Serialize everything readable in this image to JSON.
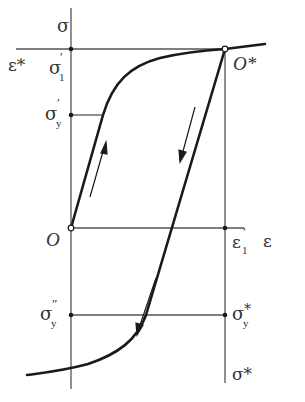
{
  "diagram": {
    "type": "stress-strain hysteresis (Bauschinger effect)",
    "colors": {
      "line": "#1a1a1a",
      "axis": "#555555",
      "text": "#333333",
      "background": "#ffffff"
    },
    "axes": {
      "y_label": "σ",
      "x_label": "ε"
    },
    "points": {
      "origin": "O",
      "reload_origin": "O*"
    },
    "labels": {
      "eps_star": "ε*",
      "sigma1_prime": {
        "base": "σ",
        "sup": "′",
        "sub": "1"
      },
      "sigmay_prime": {
        "base": "σ",
        "sup": "′",
        "sub": "y"
      },
      "eps1_prime": {
        "base": "ε",
        "sup": "′",
        "sub": "1"
      },
      "sigmay_double_prime": {
        "base": "σ",
        "sup": "″",
        "sub": "y"
      },
      "sigmay_star": {
        "base": "σ",
        "sup": "*",
        "sub": "y"
      },
      "sigma_star": "σ*"
    },
    "arrows": [
      {
        "name": "loading-direction",
        "direction": "up"
      },
      {
        "name": "unloading-direction-upper",
        "direction": "down"
      },
      {
        "name": "unloading-direction-lower",
        "direction": "down"
      }
    ]
  }
}
